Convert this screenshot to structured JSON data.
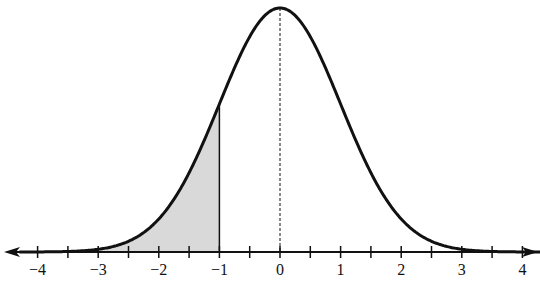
{
  "chart_data": {
    "type": "area",
    "title": "",
    "xlabel": "",
    "ylabel": "",
    "xlim": [
      -4,
      4
    ],
    "x_ticks_major": [
      -4,
      -3,
      -2,
      -1,
      0,
      1,
      2,
      3,
      4
    ],
    "x_tick_labels": [
      "−4",
      "−3",
      "−2",
      "−1",
      "0",
      "1",
      "2",
      "3",
      "4"
    ],
    "x_ticks_minor_step": 0.5,
    "series": [
      {
        "name": "standard normal density",
        "distribution": "normal",
        "mean": 0,
        "sd": 1
      }
    ],
    "shaded_region": {
      "from": -4,
      "to": -1,
      "color": "#d9d9d9"
    },
    "annotations": [
      {
        "type": "dashed-vertical-line",
        "x": 0
      },
      {
        "type": "solid-vertical-line",
        "x": -1
      }
    ],
    "grid": false,
    "legend": null
  },
  "colors": {
    "curve": "#111111",
    "shade": "#d9d9d9",
    "axis": "#111111"
  }
}
